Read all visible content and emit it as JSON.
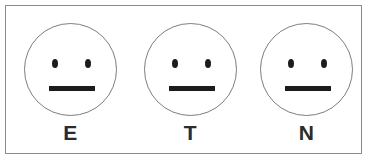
{
  "figure": {
    "frame": {
      "border_color": "#8a8a8a",
      "background_color": "#ffffff"
    },
    "style": {
      "circle_outline_color": "#7d7d7d",
      "eye_color": "#1c1c1c",
      "mouth_color": "#1c1c1c",
      "label_color": "#2b2b2b"
    },
    "faces": [
      {
        "label": "E",
        "expression": "neutral",
        "eye_shape": "vertical-ellipse",
        "mouth_shape": "straight-bar"
      },
      {
        "label": "T",
        "expression": "neutral",
        "eye_shape": "vertical-ellipse",
        "mouth_shape": "straight-bar"
      },
      {
        "label": "N",
        "expression": "neutral",
        "eye_shape": "vertical-ellipse",
        "mouth_shape": "straight-bar"
      }
    ]
  }
}
